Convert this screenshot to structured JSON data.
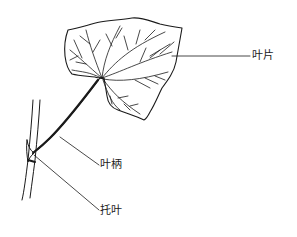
{
  "diagram": {
    "labels": [
      {
        "id": "blade",
        "text": "叶片"
      },
      {
        "id": "petiole",
        "text": "叶柄"
      },
      {
        "id": "stipule",
        "text": "托叶"
      }
    ],
    "colors": {
      "ink": "#1a1a1a",
      "background": "#ffffff"
    }
  }
}
